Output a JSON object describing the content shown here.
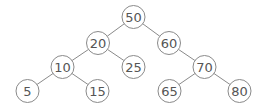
{
  "diagram": {
    "type": "binary-search-tree",
    "root": "50",
    "nodes": [
      {
        "id": "50",
        "label": "50",
        "parent": null
      },
      {
        "id": "20",
        "label": "20",
        "parent": "50",
        "side": "left"
      },
      {
        "id": "60",
        "label": "60",
        "parent": "50",
        "side": "right"
      },
      {
        "id": "10",
        "label": "10",
        "parent": "20",
        "side": "left"
      },
      {
        "id": "25",
        "label": "25",
        "parent": "20",
        "side": "right"
      },
      {
        "id": "70",
        "label": "70",
        "parent": "60",
        "side": "right"
      },
      {
        "id": "5",
        "label": "5",
        "parent": "10",
        "side": "left"
      },
      {
        "id": "15",
        "label": "15",
        "parent": "10",
        "side": "right"
      },
      {
        "id": "65",
        "label": "65",
        "parent": "70",
        "side": "left"
      },
      {
        "id": "80",
        "label": "80",
        "parent": "70",
        "side": "right"
      }
    ],
    "edges": [
      {
        "from": "50",
        "to": "20"
      },
      {
        "from": "50",
        "to": "60"
      },
      {
        "from": "20",
        "to": "10"
      },
      {
        "from": "20",
        "to": "25"
      },
      {
        "from": "60",
        "to": "70"
      },
      {
        "from": "10",
        "to": "5"
      },
      {
        "from": "10",
        "to": "15"
      },
      {
        "from": "70",
        "to": "65"
      },
      {
        "from": "70",
        "to": "80"
      }
    ],
    "colors": {
      "stroke": "#8a8a8a",
      "text": "#555555",
      "fill": "#ffffff"
    }
  }
}
